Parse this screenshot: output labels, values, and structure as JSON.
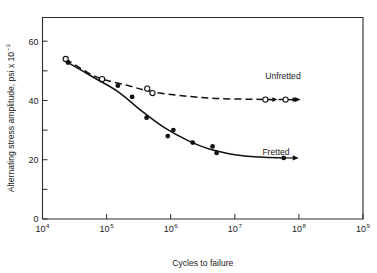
{
  "chart_data": {
    "type": "line",
    "title": "",
    "xlabel": "Cycles to failure",
    "ylabel": "Alternating stress amplitude, psi x 10",
    "ylabel_exponent": "−3",
    "xscale": "log",
    "xlim": [
      10000,
      1000000000
    ],
    "ylim": [
      0,
      68
    ],
    "grid": false,
    "legend_position": "inline-annotations",
    "x_ticks": [
      {
        "value": 10000,
        "base": "10",
        "exponent": "4",
        "label": "10⁴"
      },
      {
        "value": 100000,
        "base": "10",
        "exponent": "5",
        "label": "10⁵"
      },
      {
        "value": 1000000,
        "base": "10",
        "exponent": "6",
        "label": "10⁶"
      },
      {
        "value": 10000000,
        "base": "10",
        "exponent": "7",
        "label": "10⁷"
      },
      {
        "value": 100000000,
        "base": "10",
        "exponent": "8",
        "label": "10⁸"
      },
      {
        "value": 1000000000,
        "base": "10",
        "exponent": "9",
        "label": "10⁹"
      }
    ],
    "y_ticks": [
      {
        "value": 0,
        "label": "0",
        "major": true
      },
      {
        "value": 10,
        "label": "",
        "major": false
      },
      {
        "value": 20,
        "label": "20",
        "major": true
      },
      {
        "value": 30,
        "label": "",
        "major": false
      },
      {
        "value": 40,
        "label": "40",
        "major": true
      },
      {
        "value": 50,
        "label": "",
        "major": false
      },
      {
        "value": 60,
        "label": "60",
        "major": true
      }
    ],
    "series": [
      {
        "name": "Unfretted",
        "label": "Unfretted",
        "marker": "open-circle",
        "linestyle": "dashed",
        "color": "#111111",
        "points": [
          {
            "x": 23000,
            "y": 54.0,
            "runout": false
          },
          {
            "x": 85000,
            "y": 47.2,
            "runout": false
          },
          {
            "x": 430000,
            "y": 44.0,
            "runout": false
          },
          {
            "x": 520000,
            "y": 42.5,
            "runout": false
          },
          {
            "x": 30000000,
            "y": 40.3,
            "runout": true
          },
          {
            "x": 62000000,
            "y": 40.3,
            "runout": true
          }
        ],
        "curve": [
          {
            "x": 23000,
            "y": 54.0
          },
          {
            "x": 50000,
            "y": 49.5
          },
          {
            "x": 85000,
            "y": 47.2
          },
          {
            "x": 200000,
            "y": 45.2
          },
          {
            "x": 500000,
            "y": 43.0
          },
          {
            "x": 1500000,
            "y": 41.6
          },
          {
            "x": 5000000,
            "y": 40.7
          },
          {
            "x": 20000000,
            "y": 40.4
          },
          {
            "x": 62000000,
            "y": 40.3
          }
        ]
      },
      {
        "name": "Fretted",
        "label": "Fretted",
        "marker": "filled-circle",
        "linestyle": "solid",
        "color": "#111111",
        "points": [
          {
            "x": 25000,
            "y": 52.8,
            "runout": false
          },
          {
            "x": 150000,
            "y": 45.0,
            "runout": false
          },
          {
            "x": 250000,
            "y": 41.2,
            "runout": false
          },
          {
            "x": 420000,
            "y": 34.2,
            "runout": false
          },
          {
            "x": 900000,
            "y": 28.0,
            "runout": false
          },
          {
            "x": 1100000,
            "y": 30.0,
            "runout": false
          },
          {
            "x": 2200000,
            "y": 25.8,
            "runout": false
          },
          {
            "x": 4500000,
            "y": 24.5,
            "runout": false
          },
          {
            "x": 5200000,
            "y": 22.3,
            "runout": false
          },
          {
            "x": 58000000,
            "y": 20.6,
            "runout": true
          }
        ],
        "curve": [
          {
            "x": 25000,
            "y": 52.8
          },
          {
            "x": 60000,
            "y": 48.0
          },
          {
            "x": 150000,
            "y": 43.0
          },
          {
            "x": 350000,
            "y": 36.5
          },
          {
            "x": 800000,
            "y": 30.8
          },
          {
            "x": 1800000,
            "y": 26.6
          },
          {
            "x": 4000000,
            "y": 23.6
          },
          {
            "x": 10000000,
            "y": 21.7
          },
          {
            "x": 25000000,
            "y": 20.9
          },
          {
            "x": 58000000,
            "y": 20.6
          }
        ]
      }
    ],
    "annotations": [
      {
        "text": "Unfretted",
        "x_px": 283,
        "y_px": 79
      },
      {
        "text": "Fretted",
        "x_px": 276,
        "y_px": 155
      }
    ]
  },
  "figure": {
    "background_color": "#ffffff",
    "axis_color": "#2b2b2b",
    "series_color": "#111111"
  }
}
